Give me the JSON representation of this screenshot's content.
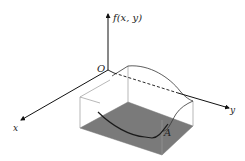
{
  "diagram": {
    "type": "3d-surface-over-region",
    "axes": {
      "vertical_label": "f(x, y)",
      "x_label": "x",
      "y_label": "y",
      "origin_label": "O"
    },
    "region_label": "A",
    "colors": {
      "region_fill": "#7a7a7a",
      "axis": "#111111",
      "box_edges": "#999999",
      "surface_curve": "#222222"
    }
  }
}
